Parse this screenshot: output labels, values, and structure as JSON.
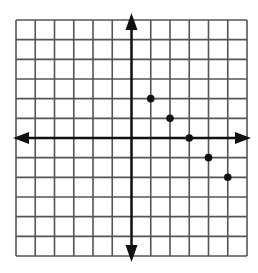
{
  "chart_data": {
    "type": "scatter",
    "title": "",
    "xlabel": "",
    "ylabel": "",
    "grid": true,
    "xlim": [
      -6,
      6
    ],
    "ylim": [
      -6,
      6
    ],
    "tick_labels": "none",
    "axes_arrows": true,
    "points": [
      {
        "x": 1,
        "y": 2
      },
      {
        "x": 2,
        "y": 1
      },
      {
        "x": 3,
        "y": 0
      },
      {
        "x": 4,
        "y": -1
      },
      {
        "x": 5,
        "y": -2
      }
    ]
  },
  "style": {
    "grid_color": "#555555",
    "axis_color": "#111111",
    "point_color": "#111111",
    "background": "#ffffff"
  },
  "layout": {
    "left": 16,
    "top": 20,
    "right": 247,
    "bottom": 256
  }
}
